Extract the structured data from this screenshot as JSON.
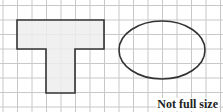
{
  "figure": {
    "caption": "Not full size",
    "grid": {
      "origin_x": 3,
      "origin_y": 5.5,
      "cell": 14.5,
      "cols": 15,
      "rows": 8,
      "line_color": "#c8c8c8"
    },
    "t_shape": {
      "fill": "#ededed",
      "stroke": "#333333",
      "points": "17,20 104,20 104,49 75,49 75,93 46,93 46,49 17,49"
    },
    "ellipse": {
      "cx": 162,
      "cy": 50,
      "rx": 43,
      "ry": 29,
      "stroke": "#333333"
    }
  }
}
